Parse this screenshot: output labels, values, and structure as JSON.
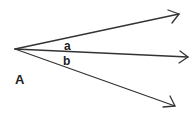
{
  "diagram": {
    "type": "angle-rays",
    "point_label": "A",
    "angle_labels": [
      "a",
      "b"
    ],
    "rays": [
      {
        "name": "upper-ray",
        "from": [
          15,
          49
        ],
        "to": [
          179,
          14
        ]
      },
      {
        "name": "middle-ray",
        "from": [
          15,
          49
        ],
        "to": [
          188,
          57
        ]
      },
      {
        "name": "lower-ray",
        "from": [
          15,
          49
        ],
        "to": [
          175,
          106
        ]
      }
    ],
    "stroke_color": "#333333",
    "background": "#ffffff"
  }
}
